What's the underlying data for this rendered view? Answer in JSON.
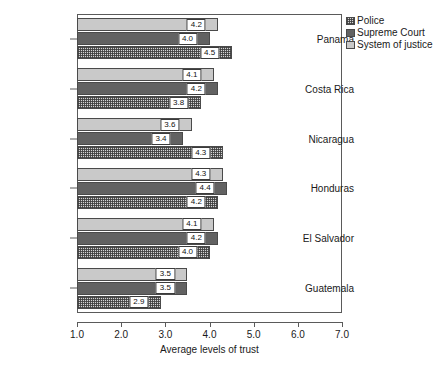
{
  "chart_data": {
    "type": "bar",
    "orientation": "horizontal",
    "title": "",
    "xlabel": "Average levels of trust",
    "ylabel": "",
    "xlim": [
      1.0,
      7.0
    ],
    "xticks": [
      "1.0",
      "2.0",
      "3.0",
      "4.0",
      "5.0",
      "6.0",
      "7.0"
    ],
    "grid": false,
    "legend_position": "top-right",
    "categories": [
      "Panama",
      "Costa Rica",
      "Nicaragua",
      "Honduras",
      "El Salvador",
      "Guatemala"
    ],
    "series": [
      {
        "name": "Police",
        "swatch": "police-pattern",
        "values": [
          4.5,
          3.8,
          4.3,
          4.2,
          4.0,
          2.9
        ],
        "labels": [
          "4.5",
          "3.8",
          "4.3",
          "4.2",
          "4.0",
          "2.9"
        ]
      },
      {
        "name": "Supreme Court",
        "swatch": "#626262",
        "values": [
          4.0,
          4.2,
          3.4,
          4.4,
          4.2,
          3.5
        ],
        "labels": [
          "4.0",
          "4.2",
          "3.4",
          "4.4",
          "4.2",
          "3.5"
        ]
      },
      {
        "name": "System of justice",
        "swatch": "#c9c9c9",
        "values": [
          4.2,
          4.1,
          3.6,
          4.3,
          4.1,
          3.5
        ],
        "labels": [
          "4.2",
          "4.1",
          "3.6",
          "4.3",
          "4.1",
          "3.5"
        ]
      }
    ]
  },
  "legend": {
    "items": [
      {
        "label": "Police"
      },
      {
        "label": "Supreme Court"
      },
      {
        "label": "System of justice"
      }
    ]
  },
  "axis": {
    "x_title": "Average levels of trust",
    "x_ticks": [
      {
        "label": "1.0"
      },
      {
        "label": "2.0"
      },
      {
        "label": "3.0"
      },
      {
        "label": "4.0"
      },
      {
        "label": "5.0"
      },
      {
        "label": "6.0"
      },
      {
        "label": "7.0"
      }
    ],
    "y_categories": [
      {
        "label": "Panama"
      },
      {
        "label": "Costa Rica"
      },
      {
        "label": "Nicaragua"
      },
      {
        "label": "Honduras"
      },
      {
        "label": "El Salvador"
      },
      {
        "label": "Guatemala"
      }
    ]
  },
  "colors": {
    "system_of_justice": "#c9c9c9",
    "supreme_court": "#626262",
    "police_base": "#d5d5d5",
    "frame": "#5a5a5a",
    "text": "#1a1a1a"
  }
}
